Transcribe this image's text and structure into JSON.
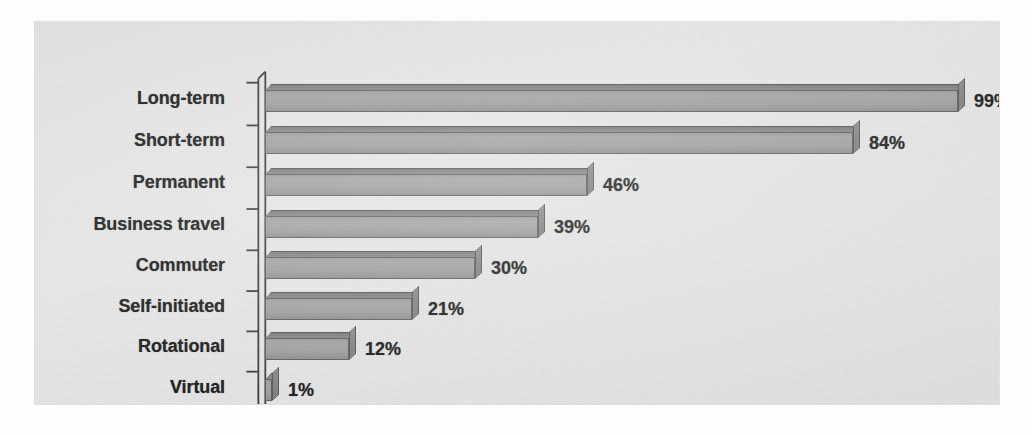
{
  "chart_data": {
    "type": "bar",
    "orientation": "horizontal",
    "title": "",
    "subtitle": "",
    "xlabel": "",
    "ylabel": "",
    "categories": [
      "Long-term",
      "Short-term",
      "Permanent",
      "Business travel",
      "Commuter",
      "Self-initiated",
      "Rotational",
      "Virtual"
    ],
    "values": [
      99,
      84,
      46,
      39,
      30,
      21,
      12,
      1
    ],
    "value_labels": [
      "99%",
      "84%",
      "46%",
      "39%",
      "30%",
      "21%",
      "12%",
      "1%"
    ],
    "units": "percent",
    "xlim": [
      0,
      100
    ],
    "grid": false,
    "legend": false,
    "legend_position": "none",
    "axis_ticks_visible": true,
    "style": "3d-horizontal-bar",
    "colors": {
      "background": "#e9e9e9",
      "bar_face": "#a2a2a2",
      "bar_top": "#7f7f7f",
      "bar_outline": "#565656",
      "text": "#1a1a1a",
      "axis": "#3a3a3a"
    }
  },
  "geometry": {
    "axis_x": 230,
    "px_per_percent": 7.0,
    "row_y": [
      76,
      118,
      160,
      202,
      243,
      284,
      324,
      365
    ],
    "note": ""
  }
}
